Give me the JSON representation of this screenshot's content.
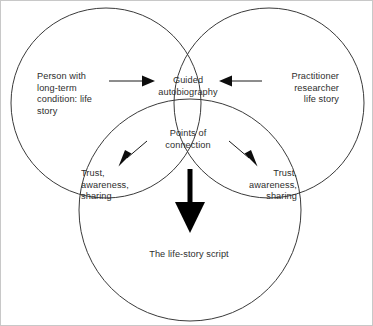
{
  "diagram": {
    "type": "venn-three-circle",
    "background_color": "#ffffff",
    "frame_border_color": "#c8c8c8",
    "circle_stroke_color": "#3a3a3a",
    "text_color": "#2e2e2e",
    "arrow_color": "#0d0d0d",
    "thick_arrow_color": "#000000",
    "circles": [
      {
        "name": "person-circle",
        "cx": 105,
        "cy": 102,
        "r": 95
      },
      {
        "name": "practitioner-circle",
        "cx": 268,
        "cy": 102,
        "r": 95
      },
      {
        "name": "script-circle",
        "cx": 189,
        "cy": 209,
        "r": 111
      }
    ],
    "labels": {
      "person_with_condition": "Person with\nlong-term\ncondition: life\nstory",
      "practitioner_researcher": "Practitioner\nresearcher\nlife story",
      "guided_autobiography": "Guided\nautobiography",
      "points_of_connection": "Points of\nconnection",
      "trust_left": "Trust,\nawareness,\nsharing",
      "trust_right": "Trust,\nawareness,\nsharing",
      "life_story_script": "The life-story script"
    },
    "arrows": [
      {
        "name": "arrow-person-to-guided",
        "direction": "right",
        "from": "Person with long-term condition: life story",
        "to": "Guided autobiography"
      },
      {
        "name": "arrow-practitioner-to-guided",
        "direction": "left",
        "from": "Practitioner researcher life story",
        "to": "Guided autobiography"
      },
      {
        "name": "arrow-connection-to-trust-left",
        "direction": "down-left",
        "from": "Points of connection",
        "to": "Trust, awareness, sharing"
      },
      {
        "name": "arrow-connection-to-trust-right",
        "direction": "down-right",
        "from": "Points of connection",
        "to": "Trust, awareness, sharing"
      },
      {
        "name": "arrow-guided-to-script",
        "direction": "down",
        "from": "Guided autobiography",
        "to": "The life-story script"
      }
    ]
  }
}
